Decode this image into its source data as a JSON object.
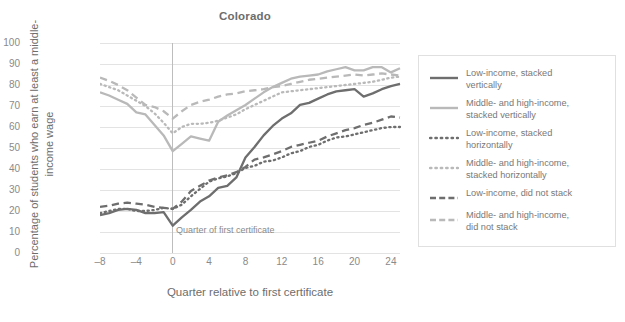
{
  "chart_data": {
    "type": "line",
    "title": "Colorado",
    "xlabel": "Quarter relative to first certificate",
    "ylabel": "Percentage of students who earn at least a middle-income wage",
    "xlim": [
      -8,
      25
    ],
    "ylim": [
      0,
      100
    ],
    "xticks": [
      -8,
      -4,
      0,
      4,
      8,
      12,
      16,
      20,
      24
    ],
    "yticks": [
      0,
      10,
      20,
      30,
      40,
      50,
      60,
      70,
      80,
      90,
      100
    ],
    "grid": true,
    "legend_position": "right",
    "annotations": [
      {
        "text": "Quarter of first certificate",
        "x": 0,
        "y": 8
      }
    ],
    "x": [
      -8,
      -7,
      -6,
      -5,
      -4,
      -3,
      -2,
      -1,
      0,
      1,
      2,
      3,
      4,
      5,
      6,
      7,
      8,
      9,
      10,
      11,
      12,
      13,
      14,
      15,
      16,
      17,
      18,
      19,
      20,
      21,
      22,
      23,
      24,
      25
    ],
    "series": [
      {
        "name": "Low-income, stacked vertically",
        "style": "solid",
        "color": "#6e6e6e",
        "width": 2.3,
        "values": [
          18,
          19,
          20.5,
          21,
          20.5,
          19,
          19,
          19.5,
          13,
          17,
          20.5,
          24.5,
          27,
          31,
          32,
          36,
          45.5,
          50.5,
          56,
          60.5,
          64,
          66.5,
          70.5,
          71.5,
          73.5,
          75.5,
          77,
          77.5,
          78,
          74.5,
          76,
          78,
          79.5,
          80.5
        ]
      },
      {
        "name": "Middle- and high-income, stacked vertically",
        "style": "solid",
        "color": "#b9b9b9",
        "width": 2.3,
        "values": [
          76.5,
          75,
          73,
          71,
          67,
          66,
          61,
          56,
          48.5,
          52,
          55.5,
          54.5,
          53.5,
          62.5,
          65.5,
          68,
          70.5,
          73.5,
          76.5,
          79,
          81,
          83,
          84,
          84.5,
          85,
          86.5,
          87.5,
          88.5,
          87,
          87,
          88.5,
          88.5,
          86,
          88
        ]
      },
      {
        "name": "Low-income, stacked horizontally",
        "style": "dotted",
        "color": "#6e6e6e",
        "width": 2.3,
        "values": [
          19,
          20,
          21,
          21,
          20,
          20,
          20.5,
          21.5,
          21,
          23,
          27,
          30.5,
          34,
          35.5,
          36.5,
          38,
          40.5,
          41.5,
          43.5,
          44,
          45.5,
          47.5,
          48.5,
          50.5,
          51.5,
          53.5,
          55,
          55.5,
          56.5,
          57.5,
          58.5,
          59.5,
          60,
          60
        ]
      },
      {
        "name": "Middle- and high-income, stacked horizontally",
        "style": "dotted",
        "color": "#b9b9b9",
        "width": 2.3,
        "values": [
          80.5,
          79,
          77.5,
          75,
          72.5,
          70,
          66.5,
          62,
          57,
          60,
          61.5,
          61.5,
          62,
          63,
          64.5,
          66,
          68.5,
          70.5,
          72.5,
          74.5,
          76.5,
          77,
          77.5,
          78,
          78.5,
          79,
          79.5,
          80,
          80.5,
          81,
          81.5,
          82.5,
          83.5,
          84
        ]
      },
      {
        "name": "Low-income, did not stack",
        "style": "dashed",
        "color": "#6e6e6e",
        "width": 2.3,
        "values": [
          22,
          22.5,
          23.5,
          24,
          23.5,
          23,
          22,
          21.5,
          21,
          24.5,
          29.5,
          32,
          34.5,
          36,
          37,
          38.5,
          41,
          44.5,
          45.5,
          47,
          48.5,
          50.5,
          51.5,
          52.5,
          53.5,
          55.5,
          57,
          58.5,
          59.5,
          61,
          62,
          63.5,
          65,
          64.5
        ]
      },
      {
        "name": "Middle- and high-income, did not stack",
        "style": "dashed",
        "color": "#b9b9b9",
        "width": 2.3,
        "values": [
          83.5,
          82,
          80,
          77.5,
          74,
          70.5,
          69.5,
          67.5,
          64,
          67.5,
          70.5,
          72,
          73,
          74.5,
          75.5,
          76,
          77,
          77.5,
          78,
          79,
          79.5,
          80.5,
          81.5,
          82.5,
          83,
          83.5,
          84,
          84.5,
          85,
          84.5,
          85,
          85.5,
          85,
          84.5
        ]
      }
    ]
  },
  "legend": {
    "items": [
      {
        "label_line1": "Low-income, stacked",
        "label_line2": "vertically"
      },
      {
        "label_line1": "Middle- and high-income,",
        "label_line2": "stacked vertically"
      },
      {
        "label_line1": "Low-income, stacked",
        "label_line2": "horizontally"
      },
      {
        "label_line1": "Middle- and high-income,",
        "label_line2": "stacked horizontally"
      },
      {
        "label_line1": "Low-income, did not stack",
        "label_line2": ""
      },
      {
        "label_line1": "Middle- and high-income,",
        "label_line2": "did not stack"
      }
    ]
  },
  "colors": {
    "dark": "#6e6e6e",
    "light": "#b9b9b9",
    "grid": "#e3e3e3",
    "text": "#7b7b7b",
    "vline": "#bdbdbd"
  }
}
